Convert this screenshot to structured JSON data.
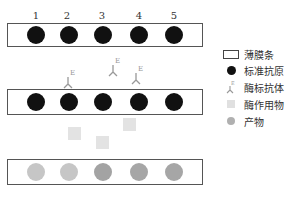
{
  "diagram": {
    "strip_labels": [
      "1",
      "2",
      "3",
      "4",
      "5"
    ],
    "antibody_label": "E",
    "colors": {
      "antigen": "#111111",
      "antibody": "#999999",
      "substrate": "#e0e0e0",
      "product_light": "#c4c4c4",
      "product_dark": "#a6a6a6",
      "strip_border": "#555555"
    }
  },
  "legend": {
    "items": [
      {
        "key": "strip",
        "label": "薄膜条"
      },
      {
        "key": "antigen",
        "label": "标准抗原"
      },
      {
        "key": "antibody",
        "label": "酶标抗体"
      },
      {
        "key": "substrate",
        "label": "酶作用物"
      },
      {
        "key": "product",
        "label": "产物"
      }
    ]
  }
}
